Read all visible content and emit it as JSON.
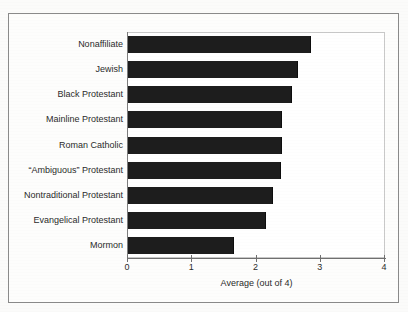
{
  "chart_data": {
    "type": "bar",
    "orientation": "horizontal",
    "title": "",
    "subtitle": "",
    "xlabel": "Average (out of 4)",
    "ylabel": "",
    "xlim": [
      0,
      4
    ],
    "xticks": [
      "0",
      "1",
      "2",
      "3",
      "4"
    ],
    "xtick_values": [
      0,
      1,
      2,
      3,
      4
    ],
    "grid": false,
    "legend": null,
    "categories": [
      "Nonaffiliate",
      "Jewish",
      "Black Protestant",
      "Mainline Protestant",
      "Roman Catholic",
      "“Ambiguous” Protestant",
      "Nontraditional Protestant",
      "Evangelical Protestant",
      "Mormon"
    ],
    "values": [
      2.85,
      2.65,
      2.55,
      2.4,
      2.4,
      2.38,
      2.25,
      2.15,
      1.65
    ],
    "bar_color": "#1d1d1d",
    "background_color": "#ffffff",
    "axis_color": "#6f6f6f"
  },
  "figure": {
    "frame_color": "#8a8a8a",
    "plot_border_color": "#c9c9c9"
  }
}
